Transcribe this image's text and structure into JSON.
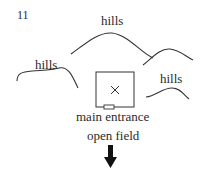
{
  "figure": {
    "number": "11",
    "labels": {
      "hills_top": "hills",
      "hills_left": "hills",
      "hills_right": "hills",
      "entrance": "main entrance",
      "field": "open field"
    },
    "building_marker": "×",
    "icons": [
      "hill-curve",
      "building-square",
      "x-mark",
      "entrance-door",
      "down-arrow"
    ],
    "colors": {
      "line": "#333333",
      "text": "#2a2a2a",
      "background": "#ffffff"
    }
  }
}
